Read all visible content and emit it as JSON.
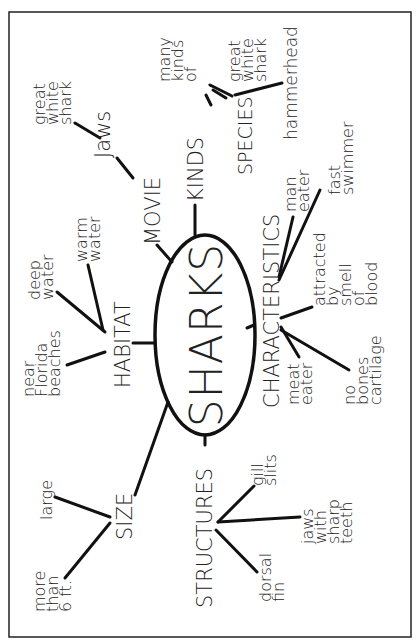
{
  "title": "SHARKS",
  "branches": {
    "movie": {
      "label": "MOVIE",
      "children": [
        {
          "label": "Jaws",
          "children": [
            [
              "great",
              "white",
              "shark"
            ]
          ]
        }
      ]
    },
    "kinds": {
      "label": "KINDS",
      "children": [
        {
          "label": "SPECIES",
          "children": [
            [
              "many",
              "kinds",
              "of"
            ],
            [
              "great",
              "white",
              "shark"
            ],
            [
              "hammerhead"
            ]
          ]
        }
      ]
    },
    "characteristics": {
      "label": "CHARACTERISTICS",
      "children": [
        [
          "man",
          "eater"
        ],
        [
          "fast",
          "swimmer"
        ],
        [
          "attracted",
          "by",
          "smell",
          "of",
          "blood"
        ],
        [
          "no",
          "bones",
          "cartilage"
        ],
        [
          "meat",
          "eater"
        ]
      ]
    },
    "structures": {
      "label": "STRUCTURES",
      "children": [
        [
          "gill",
          "slits"
        ],
        [
          "jaws",
          "with",
          "sharp",
          "teeth"
        ],
        [
          "dorsal",
          "fin"
        ]
      ]
    },
    "size": {
      "label": "SIZE",
      "children": [
        [
          "large"
        ],
        [
          "more",
          "than",
          "6 ft."
        ]
      ]
    },
    "habitat": {
      "label": "HABITAT",
      "children": [
        [
          "near",
          "Florida",
          "beaches"
        ],
        [
          "deep",
          "water"
        ],
        [
          "warm",
          "water"
        ]
      ]
    }
  }
}
